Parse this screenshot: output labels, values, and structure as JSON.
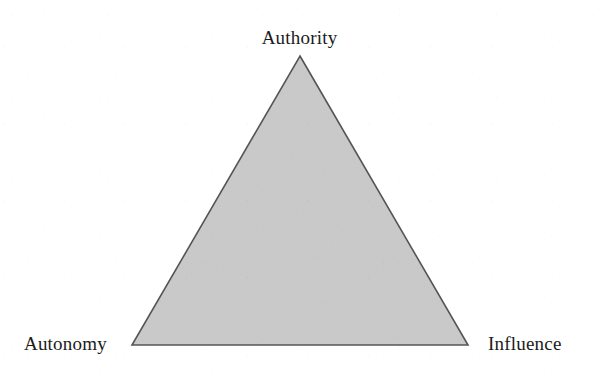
{
  "figure": {
    "type": "triangle-diagram",
    "background_color": "#ffffff",
    "shape": {
      "name": "equilateral-triangle",
      "fill_color": "#d8d8d8",
      "stroke_color": "#555555",
      "stroke_width": 1.5,
      "vertices": {
        "apex": [
          300,
          56
        ],
        "bottom_left": [
          132,
          345
        ],
        "bottom_right": [
          468,
          345
        ]
      }
    },
    "labels": {
      "apex": "Authority",
      "bottom_left": "Autonomy",
      "bottom_right": "Influence"
    },
    "label_color": "#1b1b1b",
    "label_font_size": 19
  }
}
